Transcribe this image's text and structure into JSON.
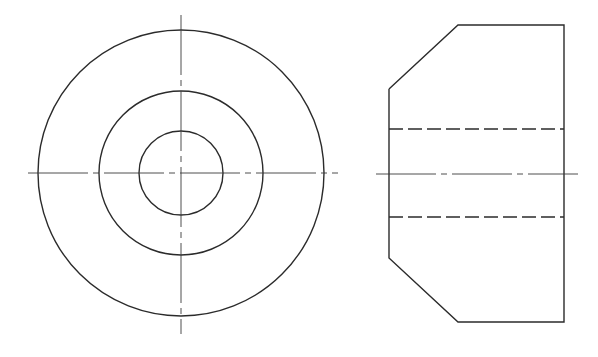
{
  "drawing": {
    "type": "orthographic-projection",
    "line_color": "#2b2b2b",
    "background": "#ffffff",
    "front_view": {
      "center": [
        181,
        173
      ],
      "circles": [
        {
          "name": "outer-diameter",
          "r": 143
        },
        {
          "name": "chamfer-edge",
          "r": 82
        },
        {
          "name": "bore",
          "r": 42
        }
      ],
      "centerlines": {
        "vertical": {
          "x": 181,
          "y1": 15,
          "y2": 334
        },
        "horizontal": {
          "y": 173,
          "x1": 28,
          "x2": 338
        }
      }
    },
    "side_view": {
      "outline_points": "389,89 458,25 564,25 564,322 458,322 389,258 389,89",
      "hidden_lines": [
        {
          "y": 129,
          "x1": 389,
          "x2": 564
        },
        {
          "y": 217,
          "x1": 389,
          "x2": 564
        }
      ],
      "centerline": {
        "y": 174,
        "x1": 376,
        "x2": 578
      }
    }
  }
}
